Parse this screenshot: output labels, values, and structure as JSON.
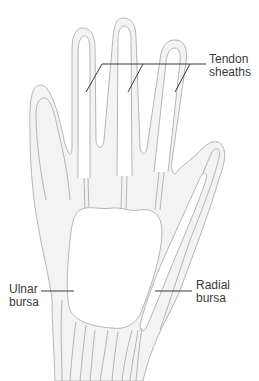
{
  "figure": {
    "colors": {
      "outline": "#b5b5b5",
      "fill": "#f3f3f3",
      "bursa_fill": "#ffffff",
      "leader": "#3a3a3a",
      "text": "#3a3a3a"
    },
    "labels": {
      "tendon_sheaths": "Tendon\nsheaths",
      "ulnar_bursa": "Ulnar\nbursa",
      "radial_bursa": "Radial\nbursa"
    }
  }
}
